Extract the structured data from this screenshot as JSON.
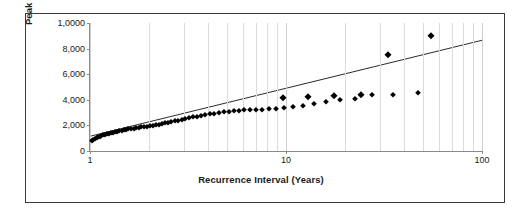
{
  "chart_data": {
    "type": "scatter",
    "title": "",
    "xlabel": "Recurrence Interval (Years)",
    "ylabel": "Peak Stream Flow (cfs)",
    "xscale": "log",
    "yscale": "linear",
    "xlim": [
      1,
      100
    ],
    "ylim": [
      0,
      10000
    ],
    "xticks": [
      "1",
      "10",
      "100"
    ],
    "xtick_values": [
      1,
      10,
      100
    ],
    "yticks": [
      "0",
      "2,000",
      "4,000",
      "6,000",
      "8,000",
      "1,0000"
    ],
    "ytick_values": [
      0,
      2000,
      4000,
      6000,
      8000,
      10000
    ],
    "grid": "vertical-log-minor",
    "legend": "none",
    "series": [
      {
        "name": "Peak Stream Flow",
        "marker": "diamond",
        "color": "#000000",
        "points": [
          [
            1.02,
            780
          ],
          [
            1.04,
            880
          ],
          [
            1.06,
            960
          ],
          [
            1.08,
            1020
          ],
          [
            1.1,
            1080
          ],
          [
            1.12,
            1130
          ],
          [
            1.14,
            1180
          ],
          [
            1.17,
            1220
          ],
          [
            1.19,
            1270
          ],
          [
            1.22,
            1310
          ],
          [
            1.25,
            1350
          ],
          [
            1.28,
            1390
          ],
          [
            1.31,
            1430
          ],
          [
            1.34,
            1470
          ],
          [
            1.37,
            1500
          ],
          [
            1.41,
            1540
          ],
          [
            1.45,
            1580
          ],
          [
            1.49,
            1610
          ],
          [
            1.53,
            1650
          ],
          [
            1.57,
            1680
          ],
          [
            1.62,
            1710
          ],
          [
            1.67,
            1750
          ],
          [
            1.72,
            1780
          ],
          [
            1.77,
            1810
          ],
          [
            1.83,
            1850
          ],
          [
            1.89,
            1880
          ],
          [
            1.95,
            1910
          ],
          [
            2.02,
            1950
          ],
          [
            2.09,
            1990
          ],
          [
            2.16,
            2030
          ],
          [
            2.24,
            2070
          ],
          [
            2.32,
            2110
          ],
          [
            2.41,
            2160
          ],
          [
            2.5,
            2210
          ],
          [
            2.6,
            2260
          ],
          [
            2.71,
            2320
          ],
          [
            2.82,
            2380
          ],
          [
            2.94,
            2440
          ],
          [
            3.07,
            2500
          ],
          [
            3.21,
            2560
          ],
          [
            3.36,
            2620
          ],
          [
            3.52,
            2680
          ],
          [
            3.69,
            2740
          ],
          [
            3.88,
            2800
          ],
          [
            4.08,
            2860
          ],
          [
            4.3,
            2910
          ],
          [
            4.54,
            2960
          ],
          [
            4.8,
            3010
          ],
          [
            5.09,
            3060
          ],
          [
            5.4,
            3100
          ],
          [
            5.75,
            3140
          ],
          [
            6.13,
            3180
          ],
          [
            6.56,
            3200
          ],
          [
            7.04,
            3200
          ],
          [
            7.58,
            3200
          ],
          [
            8.2,
            3250
          ],
          [
            8.9,
            3300
          ],
          [
            9.8,
            3350
          ],
          [
            10.9,
            3450
          ],
          [
            12.2,
            3550
          ],
          [
            13.9,
            3700
          ],
          [
            16.0,
            3850
          ],
          [
            18.8,
            3950
          ],
          [
            22.5,
            4100
          ],
          [
            27.5,
            4350
          ],
          [
            35.0,
            4400
          ],
          [
            47.0,
            4500
          ]
        ],
        "outliers": [
          [
            9.6,
            4150
          ],
          [
            13.0,
            4200
          ],
          [
            17.5,
            4300
          ],
          [
            24.0,
            4350
          ],
          [
            33.0,
            7500
          ],
          [
            55.0,
            9000
          ]
        ]
      }
    ],
    "trendline": {
      "name": "linear fit on log x",
      "color": "#2b2b2b",
      "x_start": 1.0,
      "y_start": 1150,
      "x_end": 100,
      "y_end": 8650
    }
  }
}
